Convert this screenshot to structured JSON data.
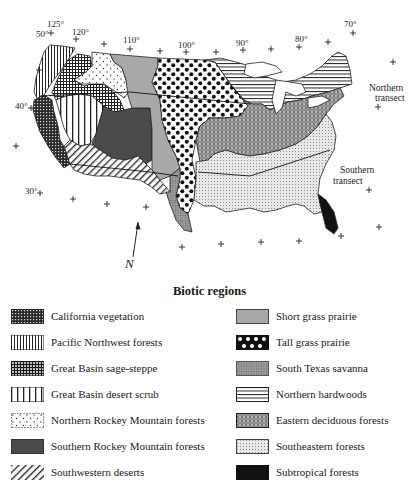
{
  "map": {
    "longitude_labels": [
      {
        "text": "125°",
        "x": 50,
        "y": 25
      },
      {
        "text": "120°",
        "x": 75,
        "y": 35
      },
      {
        "text": "110°",
        "x": 128,
        "y": 44
      },
      {
        "text": "100°",
        "x": 185,
        "y": 47
      },
      {
        "text": "90°",
        "x": 238,
        "y": 46
      },
      {
        "text": "80°",
        "x": 298,
        "y": 41
      },
      {
        "text": "70°",
        "x": 346,
        "y": 26
      }
    ],
    "latitude_labels": [
      {
        "text": "50°",
        "x": 36,
        "y": 37
      },
      {
        "text": "40°",
        "x": 15,
        "y": 107
      },
      {
        "text": "30°",
        "x": 26,
        "y": 193
      }
    ],
    "annotations": {
      "northern_transect": [
        "Northern",
        "transect"
      ],
      "southern_transect": [
        "Southern",
        "transect"
      ],
      "north_arrow": "N"
    }
  },
  "legend": {
    "title": "Biotic regions",
    "left": [
      {
        "label": "California vegetation",
        "pattern": "california"
      },
      {
        "label": "Pacific Northwest forests",
        "pattern": "pnw"
      },
      {
        "label": "Great Basin sage-steppe",
        "pattern": "sagesteppe"
      },
      {
        "label": "Great Basin desert scrub",
        "pattern": "desertscrub"
      },
      {
        "label": "Northern Rockey Mountain forests",
        "pattern": "nrocky"
      },
      {
        "label": "Southern Rockey Mountain forests",
        "pattern": "srocky"
      },
      {
        "label": "Southwestern deserts",
        "pattern": "swdesert"
      }
    ],
    "right": [
      {
        "label": "Short grass prairie",
        "pattern": "shortgrass"
      },
      {
        "label": "Tall grass prairie",
        "pattern": "tallgrass"
      },
      {
        "label": "South Texas savanna",
        "pattern": "savanna"
      },
      {
        "label": "Northern hardwoods",
        "pattern": "nhardwood"
      },
      {
        "label": "Eastern deciduous forests",
        "pattern": "edeciduous"
      },
      {
        "label": "Southeastern forests",
        "pattern": "seforest"
      },
      {
        "label": "Subtropical forests",
        "pattern": "subtropical"
      }
    ]
  }
}
